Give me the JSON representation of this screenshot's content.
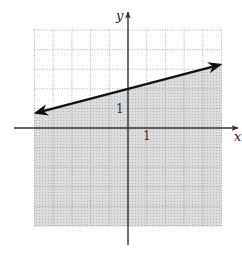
{
  "chart_data": {
    "type": "line",
    "title": "",
    "xlabel": "x",
    "ylabel": "y",
    "xlim": [
      -5,
      5
    ],
    "ylim": [
      -5,
      5
    ],
    "grid": true,
    "tick_labels": {
      "x": "1",
      "y": "1"
    },
    "series": [
      {
        "name": "boundary line y = (1/4)x + 2",
        "equation": "y = x/4 + 2",
        "slope": 0.25,
        "intercept": 2,
        "line_style": "solid",
        "arrows": "both ends",
        "x": [
          -5,
          0,
          5
        ],
        "values": [
          0.75,
          2,
          3.25
        ]
      }
    ],
    "shaded_region": "below line (y <= x/4 + 2)",
    "colors": {
      "shade": "#d9d9d9",
      "grid": "#9a9a9a",
      "line": "#111111",
      "axes": "#333333"
    }
  }
}
